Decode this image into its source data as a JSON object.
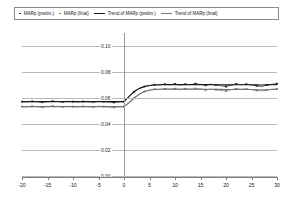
{
  "legend": {
    "items": [
      {
        "label": "MARp (prelim.)",
        "marker": "dot-dark",
        "name": "legend-marp-prelim"
      },
      {
        "label": "MARp (final)",
        "marker": "dot-grey",
        "name": "legend-marp-final"
      },
      {
        "label": "Trend of MARp (prelim.)",
        "marker": "line-dark",
        "name": "legend-trend-prelim"
      },
      {
        "label": "Trend of MARp (final)",
        "marker": "line-grey",
        "name": "legend-trend-final"
      }
    ]
  },
  "chart_data": {
    "type": "line",
    "title": "",
    "xlabel": "",
    "ylabel": "",
    "xlim": [
      -20,
      30
    ],
    "ylim": [
      0.0,
      0.11
    ],
    "grid": true,
    "legend_position": "top",
    "xticks": [
      -20,
      -15,
      -10,
      -5,
      0,
      5,
      10,
      15,
      20,
      25,
      30
    ],
    "yticks": [
      0.0,
      0.02,
      0.04,
      0.06,
      0.08,
      0.1
    ],
    "ytick_labels": [
      "0.00",
      "0.02",
      "0.04",
      "0.06",
      "0.08",
      "0.10"
    ],
    "xtick_labels": [
      "-20",
      "-15",
      "-10",
      "-5",
      "0",
      "5",
      "10",
      "15",
      "20",
      "25",
      "30"
    ],
    "event_line_x": 0,
    "x": [
      -20,
      -19,
      -18,
      -17,
      -16,
      -15,
      -14,
      -13,
      -12,
      -11,
      -10,
      -9,
      -8,
      -7,
      -6,
      -5,
      -4,
      -3,
      -2,
      -1,
      0,
      1,
      2,
      3,
      4,
      5,
      6,
      7,
      8,
      9,
      10,
      11,
      12,
      13,
      14,
      15,
      16,
      17,
      18,
      19,
      20,
      21,
      22,
      23,
      24,
      25,
      26,
      27,
      28,
      29,
      30
    ],
    "series": [
      {
        "name": "MARp (prelim.)",
        "color": "#1a1a1a",
        "style": "markers-line",
        "values": [
          0.0572,
          0.057,
          0.0574,
          0.0571,
          0.0568,
          0.0572,
          0.0575,
          0.0573,
          0.057,
          0.0574,
          0.0572,
          0.0569,
          0.0573,
          0.0571,
          0.057,
          0.0574,
          0.0572,
          0.0569,
          0.0566,
          0.057,
          0.0572,
          0.061,
          0.0648,
          0.0672,
          0.0688,
          0.0696,
          0.0702,
          0.07,
          0.0706,
          0.0702,
          0.0708,
          0.07,
          0.0706,
          0.0702,
          0.071,
          0.0704,
          0.0698,
          0.0706,
          0.07,
          0.0694,
          0.0688,
          0.07,
          0.0708,
          0.0702,
          0.0706,
          0.07,
          0.0694,
          0.0688,
          0.07,
          0.0706,
          0.071
        ]
      },
      {
        "name": "MARp (final)",
        "color": "#6e6e6e",
        "style": "markers-line",
        "values": [
          0.0534,
          0.0532,
          0.0536,
          0.0533,
          0.053,
          0.0534,
          0.0537,
          0.0535,
          0.0532,
          0.0536,
          0.0534,
          0.0531,
          0.0535,
          0.0533,
          0.0532,
          0.0536,
          0.0534,
          0.0531,
          0.0528,
          0.0532,
          0.0534,
          0.056,
          0.0598,
          0.0628,
          0.065,
          0.0662,
          0.0668,
          0.0666,
          0.067,
          0.0666,
          0.0672,
          0.0664,
          0.067,
          0.0666,
          0.0672,
          0.0668,
          0.0662,
          0.0668,
          0.0664,
          0.0658,
          0.0654,
          0.0664,
          0.067,
          0.0666,
          0.0668,
          0.0664,
          0.0658,
          0.0654,
          0.0662,
          0.0668,
          0.067
        ]
      },
      {
        "name": "Trend of MARp (prelim.)",
        "color": "#1a1a1a",
        "style": "line",
        "values": [
          0.0572,
          0.0572,
          0.0572,
          0.0572,
          0.0572,
          0.0572,
          0.0572,
          0.0572,
          0.0572,
          0.0572,
          0.0572,
          0.0572,
          0.0572,
          0.0572,
          0.0572,
          0.0572,
          0.0572,
          0.0572,
          0.0572,
          0.0572,
          0.0572,
          0.0612,
          0.065,
          0.0674,
          0.0688,
          0.0696,
          0.07,
          0.0702,
          0.0703,
          0.0703,
          0.0703,
          0.0703,
          0.0703,
          0.0703,
          0.0703,
          0.0703,
          0.0703,
          0.0703,
          0.0702,
          0.0702,
          0.0701,
          0.0701,
          0.0702,
          0.0702,
          0.0702,
          0.0702,
          0.0701,
          0.07,
          0.0701,
          0.0702,
          0.0703
        ]
      },
      {
        "name": "Trend of MARp (final)",
        "color": "#7a7a7a",
        "style": "line",
        "values": [
          0.0534,
          0.0534,
          0.0534,
          0.0534,
          0.0534,
          0.0534,
          0.0534,
          0.0534,
          0.0534,
          0.0534,
          0.0534,
          0.0534,
          0.0534,
          0.0534,
          0.0534,
          0.0534,
          0.0534,
          0.0534,
          0.0534,
          0.0534,
          0.0534,
          0.0566,
          0.0602,
          0.063,
          0.065,
          0.066,
          0.0665,
          0.0667,
          0.0668,
          0.0668,
          0.0668,
          0.0668,
          0.0668,
          0.0668,
          0.0668,
          0.0668,
          0.0667,
          0.0667,
          0.0666,
          0.0666,
          0.0665,
          0.0665,
          0.0666,
          0.0666,
          0.0666,
          0.0665,
          0.0664,
          0.0663,
          0.0664,
          0.0665,
          0.0666
        ]
      }
    ]
  }
}
